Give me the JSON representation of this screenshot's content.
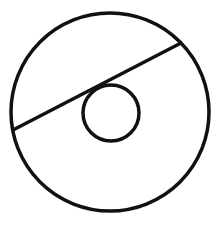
{
  "diagram": {
    "type": "geometry",
    "stroke_color": "#111111",
    "background": "#ffffff",
    "outer_circle": {
      "cx": 110,
      "cy": 112,
      "r": 99,
      "stroke_width": 3.5
    },
    "inner_circle": {
      "cx": 111,
      "cy": 113,
      "r": 28,
      "stroke_width": 3.5
    },
    "chord": {
      "x1": 13,
      "y1": 130,
      "x2": 181,
      "y2": 43,
      "stroke_width": 3.5
    }
  }
}
